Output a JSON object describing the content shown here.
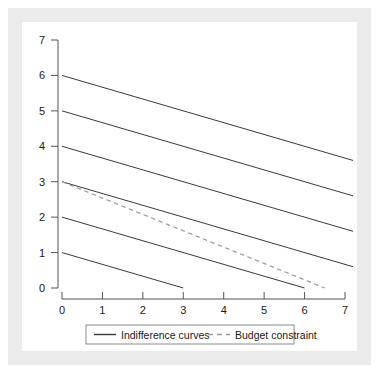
{
  "figure": {
    "frame_color": "#ebebeb",
    "plate_color": "#ffffff",
    "axis_color": "#555555",
    "curve_color": "#3a3a3a",
    "budget_color": "#9a9a9a",
    "text_color": "#1a1a1a"
  },
  "legend": {
    "position": "below-axis-center",
    "border_color": "#8a8a8a",
    "entries": [
      {
        "label": "Indifference curves",
        "style": "solid",
        "color": "#3a3a3a"
      },
      {
        "label": "Budget constraint",
        "style": "dashed",
        "color": "#9a9a9a"
      }
    ]
  },
  "axes": {
    "x": {
      "tick_labels": [
        "0",
        "1",
        "2",
        "3",
        "4",
        "5",
        "6",
        "7"
      ],
      "tick_values": [
        0,
        1,
        2,
        3,
        4,
        5,
        6,
        7
      ],
      "min": 0,
      "max": 7,
      "label": ""
    },
    "y": {
      "tick_labels": [
        "0",
        "1",
        "2",
        "3",
        "4",
        "5",
        "6",
        "7"
      ],
      "tick_values": [
        0,
        1,
        2,
        3,
        4,
        5,
        6,
        7
      ],
      "min": 0,
      "max": 7,
      "label": ""
    }
  },
  "chart_data": {
    "type": "line",
    "title": "",
    "subtitle": "",
    "xlabel": "",
    "ylabel": "",
    "xlim": [
      0,
      7
    ],
    "ylim": [
      0,
      7
    ],
    "xticks": [
      0,
      1,
      2,
      3,
      4,
      5,
      6,
      7
    ],
    "yticks": [
      0,
      1,
      2,
      3,
      4,
      5,
      6,
      7
    ],
    "grid": false,
    "legend_position": "bottom-center",
    "legend_entries": [
      "Indifference curves",
      "Budget constraint"
    ],
    "series": [
      {
        "name": "Indifference curve 6",
        "group": "Indifference curves",
        "style": "solid",
        "color": "#3a3a3a",
        "slope": -0.333,
        "intercept": 6,
        "points": [
          [
            0,
            6.0
          ],
          [
            7.2,
            3.6
          ]
        ]
      },
      {
        "name": "Indifference curve 5",
        "group": "Indifference curves",
        "style": "solid",
        "color": "#3a3a3a",
        "slope": -0.333,
        "intercept": 5,
        "points": [
          [
            0,
            5.0
          ],
          [
            7.2,
            2.6
          ]
        ]
      },
      {
        "name": "Indifference curve 4",
        "group": "Indifference curves",
        "style": "solid",
        "color": "#3a3a3a",
        "slope": -0.333,
        "intercept": 4,
        "points": [
          [
            0,
            4.0
          ],
          [
            7.2,
            1.6
          ]
        ]
      },
      {
        "name": "Indifference curve 3",
        "group": "Indifference curves",
        "style": "solid",
        "color": "#3a3a3a",
        "slope": -0.333,
        "intercept": 3,
        "points": [
          [
            0,
            3.0
          ],
          [
            7.2,
            0.6
          ]
        ]
      },
      {
        "name": "Indifference curve 2",
        "group": "Indifference curves",
        "style": "solid",
        "color": "#3a3a3a",
        "slope": -0.333,
        "intercept": 2,
        "points": [
          [
            0,
            2.0
          ],
          [
            6.0,
            0.0
          ]
        ]
      },
      {
        "name": "Indifference curve 1",
        "group": "Indifference curves",
        "style": "solid",
        "color": "#3a3a3a",
        "slope": -0.333,
        "intercept": 1,
        "points": [
          [
            0,
            1.0
          ],
          [
            3.0,
            0.0
          ]
        ]
      },
      {
        "name": "Budget constraint",
        "group": "Budget constraint",
        "style": "dashed",
        "color": "#9a9a9a",
        "slope": -0.462,
        "intercept": 3,
        "points": [
          [
            0,
            3.0
          ],
          [
            6.5,
            0.0
          ]
        ]
      }
    ]
  }
}
